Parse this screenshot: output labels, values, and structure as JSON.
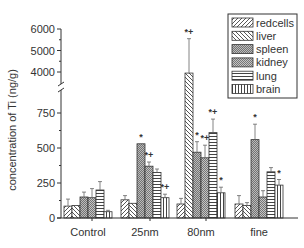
{
  "chart_data": {
    "type": "bar",
    "title": "",
    "xlabel": "",
    "ylabel": "concentration of Ti (ng/g)",
    "categories": [
      "Control",
      "25nm",
      "80nm",
      "fine"
    ],
    "y_axis": {
      "broken": true,
      "lower_range": [
        0,
        750
      ],
      "lower_ticks": [
        "0",
        "250",
        "500",
        "750"
      ],
      "upper_range": [
        3800,
        6000
      ],
      "upper_ticks": [
        "4000",
        "5000",
        "6000"
      ]
    },
    "grid": false,
    "legend_position": "upper-right",
    "series": [
      {
        "name": "redcells",
        "pattern": "diag-right",
        "values": [
          85,
          130,
          100,
          100
        ],
        "errors": [
          50,
          30,
          40,
          60
        ],
        "markers": [
          "",
          "",
          "",
          ""
        ]
      },
      {
        "name": "liver",
        "pattern": "diag-left",
        "values": [
          90,
          105,
          3950,
          90
        ],
        "errors": [
          0,
          0,
          1600,
          20
        ],
        "markers": [
          "",
          "",
          "*+",
          ""
        ]
      },
      {
        "name": "spleen",
        "pattern": "dense-diag",
        "values": [
          150,
          530,
          470,
          560
        ],
        "errors": [
          35,
          0,
          75,
          110
        ],
        "markers": [
          "",
          "*",
          "*",
          "*"
        ]
      },
      {
        "name": "kidney",
        "pattern": "dense-cross",
        "values": [
          145,
          370,
          430,
          150
        ],
        "errors": [
          65,
          30,
          90,
          45
        ],
        "markers": [
          "",
          "*+",
          "*+",
          ""
        ]
      },
      {
        "name": "lung",
        "pattern": "horizontal",
        "values": [
          200,
          325,
          610,
          330
        ],
        "errors": [
          60,
          25,
          1200,
          30
        ],
        "markers": [
          "",
          "",
          "*+",
          ""
        ]
      },
      {
        "name": "brain",
        "pattern": "vertical",
        "values": [
          45,
          145,
          180,
          235
        ],
        "errors": [
          10,
          25,
          40,
          40
        ],
        "markers": [
          "",
          "*+",
          "*",
          "*"
        ]
      }
    ]
  },
  "legend": {
    "items": [
      "redcells",
      "liver",
      "spleen",
      "kidney",
      "lung",
      "brain"
    ]
  }
}
